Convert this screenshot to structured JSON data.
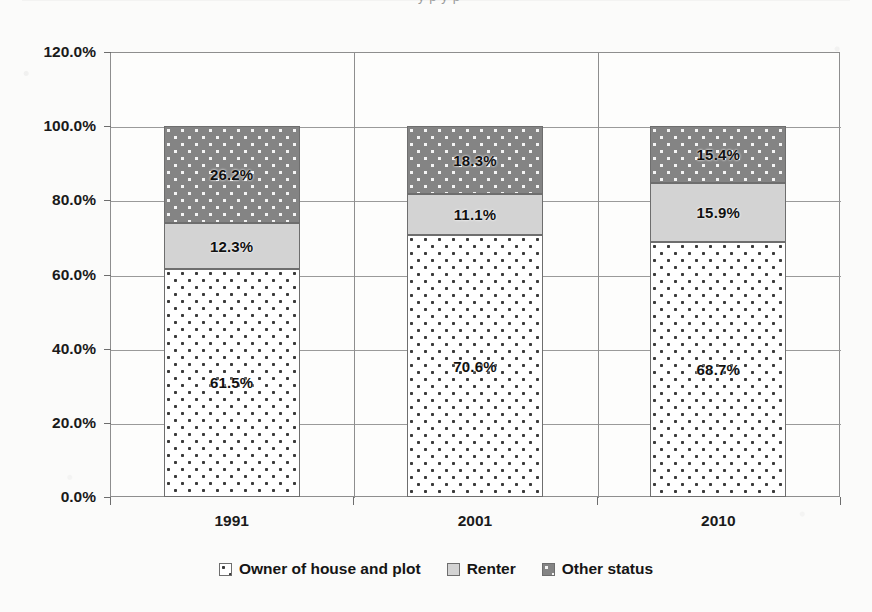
{
  "top_fragment": {
    "text": "y   p     y        p"
  },
  "chart_data": {
    "type": "bar",
    "stacked": true,
    "title": "",
    "subtitle": "",
    "xlabel": "",
    "ylabel": "",
    "ylim": [
      0,
      120
    ],
    "ytick_values": [
      0,
      20,
      40,
      60,
      80,
      100,
      120
    ],
    "ytick_labels": [
      "0.0%",
      "20.0%",
      "40.0%",
      "60.0%",
      "80.0%",
      "100.0%",
      "120.0%"
    ],
    "grid": true,
    "legend_position": "bottom",
    "categories": [
      "1991",
      "2001",
      "2010"
    ],
    "series": [
      {
        "name": "Owner of house and plot",
        "color": "#ffffff",
        "pattern": "dark-dots-on-white",
        "values": [
          61.5,
          70.6,
          68.7
        ],
        "labels": [
          "61.5%",
          "70.6%",
          "68.7%"
        ]
      },
      {
        "name": "Renter",
        "color": "#d3d3d3",
        "pattern": "solid-light-gray",
        "values": [
          12.3,
          11.1,
          15.9
        ],
        "labels": [
          "12.3%",
          "11.1%",
          "15.9%"
        ]
      },
      {
        "name": "Other status",
        "color": "#848484",
        "pattern": "white-dots-on-dark-gray",
        "values": [
          26.2,
          18.3,
          15.4
        ],
        "labels": [
          "26.2%",
          "18.3%",
          "15.4%"
        ]
      }
    ]
  },
  "legend": {
    "items": [
      {
        "label": "Owner of house and plot"
      },
      {
        "label": "Renter"
      },
      {
        "label": "Other status"
      }
    ]
  }
}
